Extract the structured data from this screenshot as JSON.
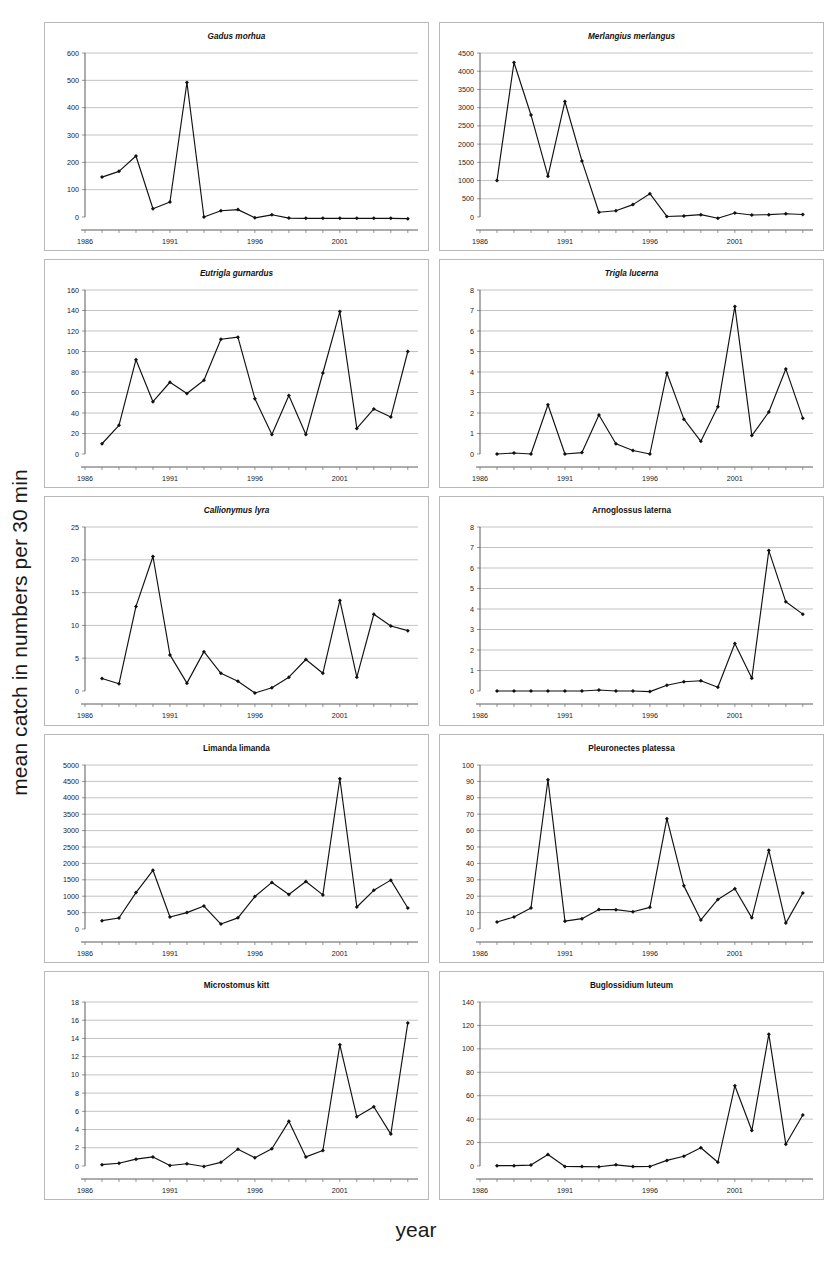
{
  "figure": {
    "ylabel": "mean catch in numbers per 30 min",
    "xlabel": "year"
  },
  "chart_data": [
    {
      "type": "line",
      "title": "Gadus morhua",
      "title_style": "italic",
      "xlabel": "",
      "ylabel": "",
      "x": [
        1987,
        1988,
        1989,
        1990,
        1991,
        1992,
        1993,
        1994,
        1995,
        1996,
        1997,
        1998,
        1999,
        2000,
        2001,
        2002,
        2003,
        2004,
        2005
      ],
      "values": [
        146,
        167,
        223,
        30,
        55,
        492,
        0,
        23,
        27,
        -3,
        8,
        -4,
        -5,
        -5,
        -5,
        -5,
        -5,
        -5,
        -6
      ],
      "xlim": [
        1986,
        2005.6
      ],
      "ylim": [
        0,
        600
      ],
      "yticks": [
        0,
        100,
        200,
        300,
        400,
        500,
        600
      ],
      "xticks": [
        1986,
        1991,
        1996,
        2001
      ],
      "grid": true,
      "legend": "none"
    },
    {
      "type": "line",
      "title": "Merlangius merlangus",
      "title_style": "italic",
      "xlabel": "",
      "ylabel": "",
      "x": [
        1987,
        1988,
        1989,
        1990,
        1991,
        1992,
        1993,
        1994,
        1995,
        1996,
        1997,
        1998,
        1999,
        2000,
        2001,
        2002,
        2003,
        2004,
        2005
      ],
      "values": [
        1000,
        4240,
        2800,
        1120,
        3170,
        1540,
        130,
        170,
        340,
        640,
        15,
        30,
        65,
        -35,
        110,
        55,
        65,
        90,
        70
      ],
      "xlim": [
        1986,
        2005.6
      ],
      "ylim": [
        0,
        4500
      ],
      "yticks": [
        0,
        500,
        1000,
        1500,
        2000,
        2500,
        3000,
        3500,
        4000,
        4500
      ],
      "xticks": [
        1986,
        1991,
        1996,
        2001
      ],
      "grid": true,
      "legend": "none"
    },
    {
      "type": "line",
      "title": "Eutrigla gurnardus",
      "title_style": "italic",
      "xlabel": "",
      "ylabel": "",
      "x": [
        1987,
        1988,
        1989,
        1990,
        1991,
        1992,
        1993,
        1994,
        1995,
        1996,
        1997,
        1998,
        1999,
        2000,
        2001,
        2002,
        2003,
        2004,
        2005
      ],
      "values": [
        10,
        28,
        92,
        51,
        70,
        59,
        72,
        112,
        114,
        54,
        19,
        57,
        19,
        79,
        139,
        25,
        44,
        36,
        100
      ],
      "xlim": [
        1986,
        2005.6
      ],
      "ylim": [
        0,
        160
      ],
      "yticks": [
        0,
        20,
        40,
        60,
        80,
        100,
        120,
        140,
        160
      ],
      "xticks": [
        1986,
        1991,
        1996,
        2001
      ],
      "grid": true,
      "legend": "none"
    },
    {
      "type": "line",
      "title": "Trigla lucerna",
      "title_style": "italic",
      "xlabel": "",
      "ylabel": "",
      "x": [
        1987,
        1988,
        1989,
        1990,
        1991,
        1992,
        1993,
        1994,
        1995,
        1996,
        1997,
        1998,
        1999,
        2000,
        2001,
        2002,
        2003,
        2004,
        2005
      ],
      "values": [
        0.0,
        0.05,
        0.0,
        2.4,
        0.0,
        0.07,
        1.9,
        0.5,
        0.17,
        0.0,
        3.95,
        1.7,
        0.62,
        2.3,
        7.2,
        0.9,
        2.05,
        4.15,
        1.75
      ],
      "xlim": [
        1986,
        2005.6
      ],
      "ylim": [
        0,
        8
      ],
      "yticks": [
        0,
        1,
        2,
        3,
        4,
        5,
        6,
        7,
        8
      ],
      "xticks": [
        1986,
        1991,
        1996,
        2001
      ],
      "grid": true,
      "legend": "none"
    },
    {
      "type": "line",
      "title": "Callionymus lyra",
      "title_style": "italic",
      "xlabel": "",
      "ylabel": "",
      "x": [
        1987,
        1988,
        1989,
        1990,
        1991,
        1992,
        1993,
        1994,
        1995,
        1996,
        1997,
        1998,
        1999,
        2000,
        2001,
        2002,
        2003,
        2004,
        2005
      ],
      "values": [
        1.9,
        1.1,
        12.9,
        20.5,
        5.5,
        1.2,
        6.0,
        2.7,
        1.5,
        -0.3,
        0.5,
        2.1,
        4.8,
        2.7,
        13.8,
        2.1,
        11.7,
        9.9,
        9.2
      ],
      "xlim": [
        1986,
        2005.6
      ],
      "ylim": [
        0,
        25
      ],
      "yticks": [
        0,
        5,
        10,
        15,
        20,
        25
      ],
      "xticks": [
        1986,
        1991,
        1996,
        2001
      ],
      "grid": true,
      "legend": "none"
    },
    {
      "type": "line",
      "title": "Arnoglossus laterna",
      "title_style": "bold",
      "xlabel": "",
      "ylabel": "",
      "x": [
        1987,
        1988,
        1989,
        1990,
        1991,
        1992,
        1993,
        1994,
        1995,
        1996,
        1997,
        1998,
        1999,
        2000,
        2001,
        2002,
        2003,
        2004,
        2005
      ],
      "values": [
        0.0,
        0.0,
        0.0,
        0.0,
        0.0,
        0.0,
        0.05,
        0.0,
        0.0,
        -0.03,
        0.28,
        0.45,
        0.5,
        0.18,
        2.32,
        0.62,
        6.85,
        4.35,
        3.75
      ],
      "xlim": [
        1986,
        2005.6
      ],
      "ylim": [
        0,
        8
      ],
      "yticks": [
        0,
        1,
        2,
        3,
        4,
        5,
        6,
        7,
        8
      ],
      "xticks": [
        1986,
        1991,
        1996,
        2001
      ],
      "grid": true,
      "legend": "none"
    },
    {
      "type": "line",
      "title": "Limanda limanda",
      "title_style": "bold",
      "xlabel": "",
      "ylabel": "",
      "x": [
        1987,
        1988,
        1989,
        1990,
        1991,
        1992,
        1993,
        1994,
        1995,
        1996,
        1997,
        1998,
        1999,
        2000,
        2001,
        2002,
        2003,
        2004,
        2005
      ],
      "values": [
        255,
        335,
        1110,
        1790,
        365,
        500,
        700,
        150,
        340,
        990,
        1420,
        1050,
        1450,
        1040,
        4580,
        670,
        1180,
        1490,
        640
      ],
      "xlim": [
        1986,
        2005.6
      ],
      "ylim": [
        0,
        5000
      ],
      "yticks": [
        0,
        500,
        1000,
        1500,
        2000,
        2500,
        3000,
        3500,
        4000,
        4500,
        5000
      ],
      "xticks": [
        1986,
        1991,
        1996,
        2001
      ],
      "grid": true,
      "legend": "none"
    },
    {
      "type": "line",
      "title": "Pleuronectes platessa",
      "title_style": "bold",
      "xlabel": "",
      "ylabel": "",
      "x": [
        1987,
        1988,
        1989,
        1990,
        1991,
        1992,
        1993,
        1994,
        1995,
        1996,
        1997,
        1998,
        1999,
        2000,
        2001,
        2002,
        2003,
        2004,
        2005
      ],
      "values": [
        4.3,
        7.3,
        12.8,
        91,
        4.8,
        6.3,
        11.9,
        11.8,
        10.5,
        13.2,
        67.3,
        26.3,
        5.5,
        18,
        24.5,
        6.8,
        48,
        3.6,
        22
      ],
      "xlim": [
        1986,
        2005.6
      ],
      "ylim": [
        0,
        100
      ],
      "yticks": [
        0,
        10,
        20,
        30,
        40,
        50,
        60,
        70,
        80,
        90,
        100
      ],
      "xticks": [
        1986,
        1991,
        1996,
        2001
      ],
      "grid": true,
      "legend": "none"
    },
    {
      "type": "line",
      "title": "Microstomus kitt",
      "title_style": "bold",
      "xlabel": "",
      "ylabel": "",
      "x": [
        1987,
        1988,
        1989,
        1990,
        1991,
        1992,
        1993,
        1994,
        1995,
        1996,
        1997,
        1998,
        1999,
        2000,
        2001,
        2002,
        2003,
        2004,
        2005
      ],
      "values": [
        0.15,
        0.3,
        0.75,
        1.0,
        0.05,
        0.25,
        -0.05,
        0.4,
        1.85,
        0.9,
        1.9,
        4.9,
        1.0,
        1.7,
        13.3,
        5.4,
        6.5,
        3.5,
        15.7
      ],
      "xlim": [
        1986,
        2005.6
      ],
      "ylim": [
        0,
        18
      ],
      "yticks": [
        0,
        2,
        4,
        6,
        8,
        10,
        12,
        14,
        16,
        18
      ],
      "xticks": [
        1986,
        1991,
        1996,
        2001
      ],
      "grid": true,
      "legend": "none"
    },
    {
      "type": "line",
      "title": "Buglossidium luteum",
      "title_style": "bold",
      "xlabel": "",
      "ylabel": "",
      "x": [
        1987,
        1988,
        1989,
        1990,
        1991,
        1992,
        1993,
        1994,
        1995,
        1996,
        1997,
        1998,
        1999,
        2000,
        2001,
        2002,
        2003,
        2004,
        2005
      ],
      "values": [
        0.3,
        0.3,
        0.8,
        9.8,
        -0.4,
        -0.5,
        -0.6,
        1.0,
        -0.5,
        -0.4,
        4.8,
        8.3,
        15.6,
        3.2,
        68.5,
        30.3,
        112.5,
        18.5,
        43.5
      ],
      "xlim": [
        1986,
        2005.6
      ],
      "ylim": [
        0,
        140
      ],
      "yticks": [
        0,
        20,
        40,
        60,
        80,
        100,
        120,
        140
      ],
      "xticks": [
        1986,
        1991,
        1996,
        2001
      ],
      "grid": true,
      "legend": "none"
    }
  ]
}
